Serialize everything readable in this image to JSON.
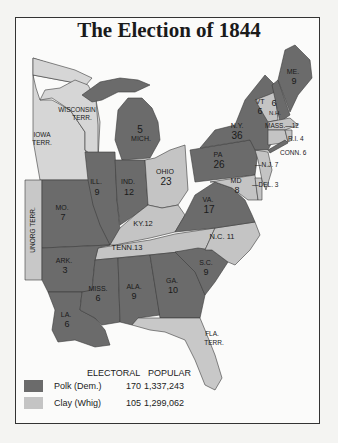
{
  "title": "The Election of 1844",
  "colors": {
    "polk": "#6b6b6b",
    "clay": "#c4c4c4",
    "territory": "#dcdcdc",
    "water": "#fbfbfa",
    "frame": "#333333"
  },
  "states": [
    {
      "abbr": "ME.",
      "votes": "9",
      "party": "polk"
    },
    {
      "abbr": "VT",
      "votes": "6",
      "party": "clay"
    },
    {
      "abbr": "N.H.",
      "votes": "6",
      "party": "polk"
    },
    {
      "abbr": "MASS.",
      "votes": "12",
      "party": "clay"
    },
    {
      "abbr": "R.I.",
      "votes": "4",
      "party": "clay"
    },
    {
      "abbr": "CONN.",
      "votes": "6",
      "party": "clay"
    },
    {
      "abbr": "N.Y.",
      "votes": "36",
      "party": "polk"
    },
    {
      "abbr": "N.J.",
      "votes": "7",
      "party": "clay"
    },
    {
      "abbr": "PA",
      "votes": "26",
      "party": "polk"
    },
    {
      "abbr": "DEL.",
      "votes": "3",
      "party": "clay"
    },
    {
      "abbr": "MD",
      "votes": "8",
      "party": "clay"
    },
    {
      "abbr": "VA.",
      "votes": "17",
      "party": "polk"
    },
    {
      "abbr": "N.C.",
      "votes": "11",
      "party": "clay"
    },
    {
      "abbr": "S.C.",
      "votes": "9",
      "party": "polk"
    },
    {
      "abbr": "GA.",
      "votes": "10",
      "party": "polk"
    },
    {
      "abbr": "OHIO",
      "votes": "23",
      "party": "clay"
    },
    {
      "abbr": "MICH.",
      "votes": "5",
      "party": "polk"
    },
    {
      "abbr": "IND.",
      "votes": "12",
      "party": "polk"
    },
    {
      "abbr": "ILL.",
      "votes": "9",
      "party": "polk"
    },
    {
      "abbr": "KY.",
      "votes": "12",
      "party": "clay"
    },
    {
      "abbr": "TENN.",
      "votes": "13",
      "party": "clay"
    },
    {
      "abbr": "ALA.",
      "votes": "9",
      "party": "polk"
    },
    {
      "abbr": "MISS.",
      "votes": "6",
      "party": "polk"
    },
    {
      "abbr": "LA.",
      "votes": "6",
      "party": "polk"
    },
    {
      "abbr": "ARK.",
      "votes": "3",
      "party": "polk"
    },
    {
      "abbr": "MO.",
      "votes": "7",
      "party": "polk"
    }
  ],
  "territories": [
    {
      "name": "WISCONSIN",
      "sub": "TERR."
    },
    {
      "name": "IOWA",
      "sub": "TERR."
    },
    {
      "name": "UNORG TERR.",
      "sub": ""
    },
    {
      "name": "FLA.",
      "sub": "TERR."
    }
  ],
  "labels": {
    "me_a": "ME.",
    "me_v": "9",
    "vt_a": "VT",
    "vt_v": "6",
    "nh_v": "6",
    "nh_a": "N.H.",
    "mass": "MASS.—12",
    "ri": "R.I. 4",
    "conn": "CONN. 6",
    "nj": "—N.J. 7",
    "del": "—DEL. 3",
    "md_a": "MD",
    "md_v": "8",
    "ny_a": "N.Y.",
    "ny_v": "36",
    "pa_a": "PA",
    "pa_v": "26",
    "va_a": "VA.",
    "va_v": "17",
    "nc": "N.C. 11",
    "sc_a": "S.C.",
    "sc_v": "9",
    "ga_a": "GA.",
    "ga_v": "10",
    "ohio_a": "OHIO",
    "ohio_v": "23",
    "mich_v": "5",
    "mich_a": "MICH.",
    "ind_a": "IND.",
    "ind_v": "12",
    "ill_a": "ILL.",
    "ill_v": "9",
    "ky": "KY.12",
    "tenn": "TENN.13",
    "ala_a": "ALA.",
    "ala_v": "9",
    "miss_a": "MISS.",
    "miss_v": "6",
    "la_a": "LA.",
    "la_v": "6",
    "ark_a": "ARK.",
    "ark_v": "3",
    "mo_a": "MO.",
    "mo_v": "7",
    "wis_a": "WISCONSIN",
    "wis_b": "TERR.",
    "iowa_a": "IOWA",
    "iowa_b": "TERR.",
    "unorg": "UNORG TERR.",
    "fla_a": "FLA.",
    "fla_b": "TERR."
  },
  "legend": {
    "col_electoral": "ELECTORAL",
    "col_popular": "POPULAR",
    "rows": [
      {
        "name": "Polk (Dem.)",
        "electoral": "170",
        "popular": "1,337,243",
        "color": "#6b6b6b"
      },
      {
        "name": "Clay (Whig)",
        "electoral": "105",
        "popular": "1,299,062",
        "color": "#c4c4c4"
      }
    ]
  }
}
